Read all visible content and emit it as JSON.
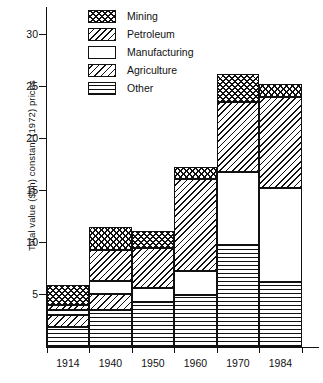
{
  "chart_data": {
    "type": "bar",
    "title": "",
    "subtitle": "",
    "xlabel": "",
    "ylabel": "Total value ($bn) constant (1972) prices",
    "stacked": true,
    "grid": false,
    "legend_position": "top-center",
    "categories": [
      "1914",
      "1940",
      "1950",
      "1960",
      "1970",
      "1984"
    ],
    "ylim": [
      0,
      30
    ],
    "yticks": [
      5,
      10,
      15,
      20,
      25,
      30
    ],
    "ytick_labels": [
      "5",
      "10",
      "15",
      "20",
      "25",
      "30"
    ],
    "series": [
      {
        "name": "Mining",
        "pattern": "cross-hatch",
        "values": [
          1.9,
          2.2,
          1.6,
          1.2,
          2.7,
          1.3
        ]
      },
      {
        "name": "Petroleum",
        "pattern": "diagonal-hatch",
        "values": [
          0.5,
          3.0,
          3.9,
          8.8,
          6.7,
          8.7
        ]
      },
      {
        "name": "Manufacturing",
        "pattern": "blank",
        "values": [
          0.5,
          1.2,
          1.3,
          2.3,
          7.0,
          9.1
        ]
      },
      {
        "name": "Agriculture",
        "pattern": "diagonal-hatch-light",
        "values": [
          1.1,
          1.6,
          0.0,
          0.0,
          0.0,
          0.0
        ]
      },
      {
        "name": "Other",
        "pattern": "horizontal-lines",
        "values": [
          1.9,
          3.5,
          4.3,
          5.0,
          9.8,
          6.2
        ]
      }
    ],
    "totals": [
      5.9,
      11.5,
      11.1,
      17.3,
      26.2,
      25.3
    ],
    "stack_order_top_to_bottom": [
      "Mining",
      "Petroleum",
      "Manufacturing",
      "Agriculture",
      "Other"
    ]
  },
  "legend": {
    "items": [
      {
        "label": "Mining"
      },
      {
        "label": "Petroleum"
      },
      {
        "label": "Manufacturing"
      },
      {
        "label": "Agriculture"
      },
      {
        "label": "Other"
      }
    ]
  },
  "axes": {
    "y_title": "Total value ($bn) constant (1972) prices"
  }
}
